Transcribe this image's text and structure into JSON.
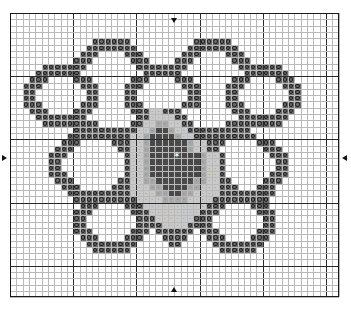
{
  "document": {
    "type": "cross-stitch-pattern-chart",
    "title": "Hexagonal flower cross stitch chart"
  },
  "grid": {
    "columns": 52,
    "rows": 45,
    "cell_size_px": 6.32,
    "origin_x_px": 10,
    "origin_y_px": 13,
    "minor_line_color": "#b9b9b9",
    "major_line_color": "#2a2a2a",
    "major_every": 10,
    "border_color": "#1a1a1a",
    "background_color": "#ffffff"
  },
  "markers": {
    "center_star": {
      "label": "center-star",
      "glyph": "✶",
      "color": "#ffffff",
      "col": 26,
      "row": 23
    },
    "edge_arrows": [
      {
        "name": "top-center-arrow",
        "direction": "down",
        "col": 26,
        "edge": "top"
      },
      {
        "name": "bottom-center-arrow",
        "direction": "up",
        "col": 26,
        "edge": "bottom"
      },
      {
        "name": "left-center-arrow",
        "direction": "right",
        "row": 23,
        "edge": "left"
      },
      {
        "name": "right-center-arrow",
        "direction": "left",
        "row": 23,
        "edge": "right"
      }
    ]
  },
  "legend": {
    "symbols": [
      {
        "key": "O",
        "name": "dark-gray-ring",
        "fill": "#6b6b6b",
        "glyph": "o",
        "glyph_color": "#1e1e1e"
      },
      {
        "key": "D",
        "name": "dark-gray-plain",
        "fill": "#676767",
        "glyph": "",
        "glyph_color": "#1e1e1e"
      },
      {
        "key": "L",
        "name": "light-gray-dotted",
        "fill": "#c9c9c9",
        "glyph": "·",
        "glyph_color": "#3a3a3a"
      },
      {
        "key": "M",
        "name": "mid-gray-dotted",
        "fill": "#a8a8a8",
        "glyph": "·",
        "glyph_color": "#2a2a2a"
      },
      {
        "key": "K",
        "name": "near-black",
        "fill": "#4a4a4a",
        "glyph": "·",
        "glyph_color": "#0d0d0d"
      },
      {
        "key": ".",
        "name": "empty",
        "fill": "transparent",
        "glyph": "",
        "glyph_color": ""
      }
    ]
  },
  "chart_data": {
    "type": "heatmap",
    "xlabel": "",
    "ylabel": "",
    "grid": true,
    "legend_position": "none",
    "categories": [],
    "values": [],
    "width": 52,
    "height": 45,
    "palette": {
      "O": "#6b6b6b",
      "D": "#676767",
      "L": "#c9c9c9",
      "M": "#a8a8a8",
      "K": "#4a4a4a",
      ".": "#ffffff"
    },
    "rows": [
      "....................................................",
      "....................................................",
      "....................................................",
      "....................................................",
      ".............OOOOOO..........OOOOOO.................",
      "............OOOOOOOO........OOOOOOOO................",
      "...........OOO....OOO......OOO....OOO...............",
      "..........OOO......OOO....OOO......OOO..............",
      ".....OOOOOOO........OOOOOOOO........OOOOOOO.........",
      "....OOOOOOO..........OOOOOO..........OOOOOOO........",
      "...OOO....OOO......OOO....OOO......OOO....OOO.......",
      "..OOO......OOO....OOO......OOO....OOO......OOO......",
      "..OO........OO....OO........OO....OO........OO......",
      "..OO........OO....OO........OO....OO........OO......",
      "..OOO......OOO....OOO......OOO....OOO......OOO......",
      "...OOO....OOO......OOOLLOOO........OOO....OOO.......",
      "....OOOOOOOO........OOLLLLOO........OOOOOOOO........",
      ".....OOOOOOOOO.....OOLLMMLLOO.....OOOOOOOOO.........",
      "..........OOOOOOOOOOLLMKKMLLOOOOOOOOOO..............",
      ".........OOOOOOOOOOLLMKKKKMLLOOOOOOOOOO.............",
      "........OOO.....OOOLLMKKKKKKMLLOOO.....OOO..........",
      ".......OOO.......OOLLMKK**KKMLLOO.......OOO.........",
      "......OOO.........OLLMKKK**KKKMLLO.......OOO........",
      "......OO..........OLLMKKK**KKKMLLO........OO........",
      "......OO..........OLLMKKK**KKKMLLO........OO........",
      "......OOO.........OLLMKKKKKKKKMLLO.......OOO........",
      ".......OOO.......OOLLMMKKKKKKMMLLOO.....OOO.........",
      "........OOO.....OOOLLLMMKKKKMMLLLOOO...OOO..........",
      ".........OOOOOOOOOOLLLLMMKKMMLLLLOOOOOOOOO..........",
      "..........OOOOOOOOOOLLLLMMMMLLLLOOOOOOOOO...........",
      "...........OOO....OOOLLLLLLLLLLOOO....OOO...........",
      "..........OOO......OOOLLLLLLLLOOO......OOO..........",
      "..........OO........OOOLLLLLLOOO........OO..........",
      "..........OO........OOOOLLLLOOOO........OO..........",
      "..........OOO......OOO.OOOOOO.OOO......OOO..........",
      "...........OOO....OOO...OOOO...OOO....OOO...........",
      "............OOOOOOOO.....OO.....OOOOOOOO............",
      ".............OOOOOO..............OOOOOO.............",
      "....................................................",
      "....................................................",
      "....................................................",
      "....................................................",
      "....................................................",
      "....................................................",
      "...................................................."
    ]
  }
}
